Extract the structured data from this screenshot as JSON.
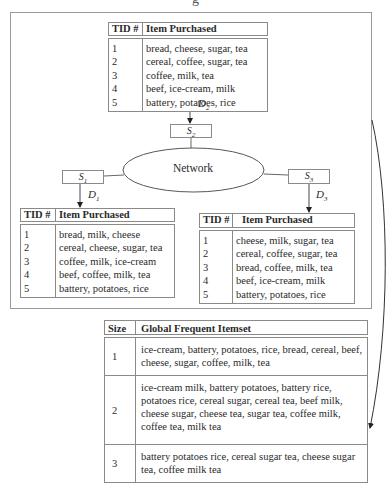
{
  "figure": {
    "cutoff_caption": "g"
  },
  "top_table": {
    "site_id_label": "D",
    "site_id_sub": "2",
    "headers": {
      "tid": "TID #",
      "items": "Item Purchased"
    },
    "rows": [
      {
        "tid": "1",
        "items": "bread, cheese, sugar, tea"
      },
      {
        "tid": "2",
        "items": "cereal, coffee, sugar, tea"
      },
      {
        "tid": "3",
        "items": "coffee, milk, tea"
      },
      {
        "tid": "4",
        "items": "beef, ice-cream, milk"
      },
      {
        "tid": "5",
        "items": "battery, potatoes, rice"
      }
    ]
  },
  "network": {
    "label": "Network",
    "sites": [
      {
        "name": "S",
        "sub": "1"
      },
      {
        "name": "S",
        "sub": "2"
      },
      {
        "name": "S",
        "sub": "3"
      }
    ],
    "databases": [
      {
        "name": "D",
        "sub": "1"
      },
      {
        "name": "D",
        "sub": "2"
      },
      {
        "name": "D",
        "sub": "3"
      }
    ]
  },
  "left_table": {
    "headers": {
      "tid": "TID #",
      "items": "Item Purchased"
    },
    "rows": [
      {
        "tid": "1",
        "items": "bread, milk, cheese"
      },
      {
        "tid": "2",
        "items": "cereal, cheese, sugar, tea"
      },
      {
        "tid": "3",
        "items": "coffee, milk, ice-cream"
      },
      {
        "tid": "4",
        "items": "beef, coffee, milk, tea"
      },
      {
        "tid": "5",
        "items": "battery, potatoes, rice"
      }
    ]
  },
  "right_table": {
    "headers": {
      "tid": "TID #",
      "items": "Item Purchased"
    },
    "rows": [
      {
        "tid": "1",
        "items": "cheese, milk, sugar, tea"
      },
      {
        "tid": "2",
        "items": "cereal, coffee, sugar, tea"
      },
      {
        "tid": "3",
        "items": "bread, coffee, milk, tea"
      },
      {
        "tid": "4",
        "items": "beef, ice-cream, milk"
      },
      {
        "tid": "5",
        "items": "battery, potatoes, rice"
      }
    ]
  },
  "global_table": {
    "headers": {
      "size": "Size",
      "itemset": "Global Frequent Itemset"
    },
    "rows": [
      {
        "size": "1",
        "itemset": "ice-cream, battery, potatoes, rice, bread, cereal, beef, cheese, sugar, coffee, milk, tea"
      },
      {
        "size": "2",
        "itemset": "ice-cream milk, battery potatoes, battery rice, potatoes rice, cereal sugar, cereal tea, beef milk, cheese sugar, cheese tea, sugar tea, coffee milk, coffee tea, milk tea"
      },
      {
        "size": "3",
        "itemset": "battery potatoes rice, cereal sugar tea, cheese sugar tea, coffee milk tea"
      }
    ]
  }
}
